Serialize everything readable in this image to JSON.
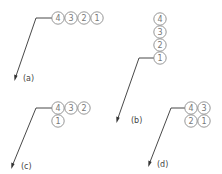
{
  "diagram": {
    "type": "stacked balloon leader arrangements",
    "colors": {
      "balloon_stroke": "#8a8a8a",
      "number": "#777777",
      "leader": "#333333",
      "label": "#444444"
    },
    "panels": [
      {
        "id": "a",
        "label": "(a)",
        "arrangement": "horizontal row",
        "balloons": [
          {
            "number": "4",
            "cx": 58,
            "cy": 18
          },
          {
            "number": "3",
            "cx": 71,
            "cy": 18
          },
          {
            "number": "2",
            "cx": 84,
            "cy": 18
          },
          {
            "number": "1",
            "cx": 97,
            "cy": 18
          }
        ]
      },
      {
        "id": "b",
        "label": "(b)",
        "arrangement": "vertical column",
        "balloons": [
          {
            "number": "4",
            "cx": 160,
            "cy": 19
          },
          {
            "number": "3",
            "cx": 160,
            "cy": 32
          },
          {
            "number": "2",
            "cx": 160,
            "cy": 45
          },
          {
            "number": "1",
            "cx": 160,
            "cy": 58
          }
        ]
      },
      {
        "id": "c",
        "label": "(c)",
        "arrangement": "row of three with one below",
        "balloons": [
          {
            "number": "4",
            "cx": 58,
            "cy": 108
          },
          {
            "number": "3",
            "cx": 71,
            "cy": 108
          },
          {
            "number": "2",
            "cx": 84,
            "cy": 108
          },
          {
            "number": "1",
            "cx": 58,
            "cy": 121
          }
        ]
      },
      {
        "id": "d",
        "label": "(d)",
        "arrangement": "2x2 grid",
        "balloons": [
          {
            "number": "4",
            "cx": 191,
            "cy": 108
          },
          {
            "number": "3",
            "cx": 204,
            "cy": 108
          },
          {
            "number": "2",
            "cx": 191,
            "cy": 121
          },
          {
            "number": "1",
            "cx": 204,
            "cy": 121
          }
        ]
      }
    ]
  }
}
